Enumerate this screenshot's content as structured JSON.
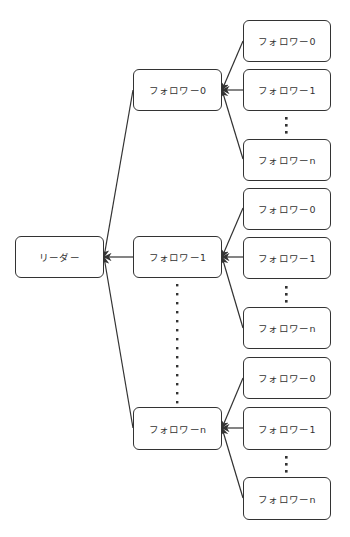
{
  "diagram": {
    "colors": {
      "stroke": "#333333",
      "node_fill": "#ffffff",
      "text": "#333333",
      "background": "#ffffff"
    },
    "leader": {
      "label": "リーダー"
    },
    "groups": [
      {
        "parent": {
          "label": "フォロワー0"
        },
        "children": [
          {
            "label": "フォロワー0"
          },
          {
            "label": "フォロワー1"
          },
          {
            "label": "フォロワーn"
          }
        ],
        "ellipsis": "⋮"
      },
      {
        "parent": {
          "label": "フォロワー1"
        },
        "children": [
          {
            "label": "フォロワー0"
          },
          {
            "label": "フォロワー1"
          },
          {
            "label": "フォロワーn"
          }
        ],
        "ellipsis": "⋮"
      },
      {
        "parent": {
          "label": "フォロワーn"
        },
        "children": [
          {
            "label": "フォロワー0"
          },
          {
            "label": "フォロワー1"
          },
          {
            "label": "フォロワーn"
          }
        ],
        "ellipsis": "⋮"
      }
    ],
    "middle_ellipsis": "⋮",
    "edges": [
      {
        "from": "groups.0.parent",
        "to": "leader"
      },
      {
        "from": "groups.1.parent",
        "to": "leader"
      },
      {
        "from": "groups.2.parent",
        "to": "leader"
      },
      {
        "from": "groups.0.children.0",
        "to": "groups.0.parent"
      },
      {
        "from": "groups.0.children.1",
        "to": "groups.0.parent"
      },
      {
        "from": "groups.0.children.2",
        "to": "groups.0.parent"
      },
      {
        "from": "groups.1.children.0",
        "to": "groups.1.parent"
      },
      {
        "from": "groups.1.children.1",
        "to": "groups.1.parent"
      },
      {
        "from": "groups.1.children.2",
        "to": "groups.1.parent"
      },
      {
        "from": "groups.2.children.0",
        "to": "groups.2.parent"
      },
      {
        "from": "groups.2.children.1",
        "to": "groups.2.parent"
      },
      {
        "from": "groups.2.children.2",
        "to": "groups.2.parent"
      }
    ]
  }
}
